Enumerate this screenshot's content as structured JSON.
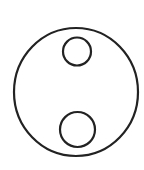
{
  "diagram": {
    "background": "#ffffff",
    "stroke_color": "#222222",
    "stroke_width": 2.2,
    "shapes": [
      {
        "id": "outer-circle",
        "type": "ellipse",
        "cx": 76,
        "cy": 92,
        "rx": 62,
        "ry": 64
      },
      {
        "id": "top-inner-circle",
        "type": "circle",
        "cx": 77,
        "cy": 51.5,
        "r": 14
      },
      {
        "id": "bottom-inner-circle",
        "type": "circle",
        "cx": 77.5,
        "cy": 129.5,
        "r": 17.5
      }
    ]
  }
}
